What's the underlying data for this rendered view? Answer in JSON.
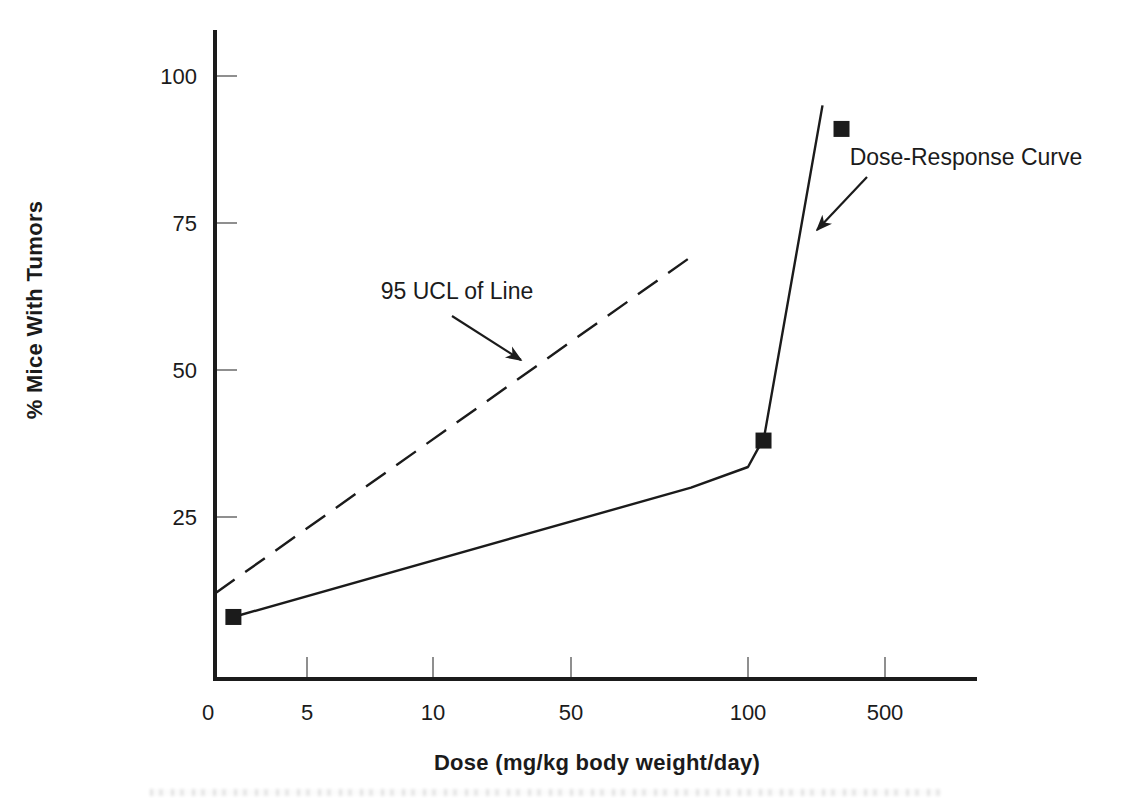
{
  "figure": {
    "background": "#ffffff",
    "ink_color": "#1b1b1b",
    "tick_color": "#8f8f8f"
  },
  "chart_data": {
    "type": "line",
    "title": "",
    "xlabel": "Dose (mg/kg body weight/day)",
    "ylabel": "% Mice With Tumors",
    "x_axis": {
      "scale": "quasi-log",
      "ticks": [
        {
          "label": "0",
          "dose": 0,
          "label_dx": -7
        },
        {
          "label": "5",
          "dose": 5
        },
        {
          "label": "10",
          "dose": 10
        },
        {
          "label": "50",
          "dose": 50
        },
        {
          "label": "100",
          "dose": 100
        },
        {
          "label": "500",
          "dose": 500
        }
      ]
    },
    "y_axis": {
      "ticks": [
        25,
        50,
        75,
        100
      ],
      "range": [
        0,
        108
      ],
      "grid": false
    },
    "series": [
      {
        "name": "Dose-Response Curve",
        "line": "solid",
        "marker": "square",
        "points": [
          [
            1,
            8
          ],
          [
            80,
            30
          ],
          [
            100,
            33.5
          ],
          [
            112,
            36.5
          ],
          [
            120,
            38
          ],
          [
            240,
            95
          ]
        ],
        "marker_points": [
          [
            1,
            8
          ],
          [
            120,
            38
          ],
          [
            300,
            91
          ]
        ]
      },
      {
        "name": "95 UCL of Line",
        "line": "dashed",
        "marker": "none",
        "points": [
          [
            0,
            12
          ],
          [
            82,
            70
          ]
        ]
      }
    ],
    "annotations": [
      {
        "text": "95 UCL of Line",
        "tx": 457,
        "ty": 299,
        "arrow": [
          452,
          316,
          521,
          360
        ]
      },
      {
        "text": "Dose-Response Curve",
        "tx": 966,
        "ty": 165,
        "arrow": [
          867,
          177,
          817,
          230
        ]
      }
    ],
    "layout": {
      "y_axis_x": 215,
      "y_axis_top": 30,
      "x_axis_y": 679,
      "x_axis_x2": 977,
      "x_tick_px": [
        215,
        307,
        433,
        571,
        748,
        885
      ],
      "y_zero_px": 664,
      "y_px_per_unit": 5.88,
      "tick_len": 20,
      "marker_size": 16,
      "legend": "none"
    }
  }
}
